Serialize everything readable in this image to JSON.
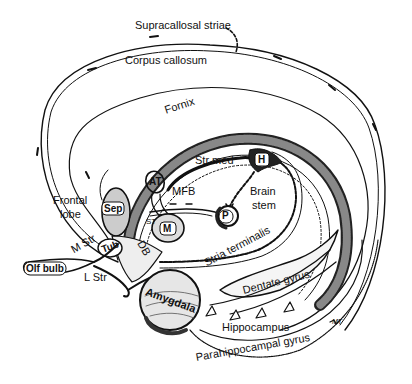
{
  "diagram": {
    "colors": {
      "ink": "#111111",
      "background": "#ffffff",
      "shade": "#555555"
    },
    "labels": {
      "supracallosal_striae": "Supracallosal striae",
      "corpus_callosum": "Corpus callosum",
      "fornix": "Fornix",
      "str_med": "Str med",
      "habenula": "H",
      "brain_stem_line1": "Brain",
      "brain_stem_line2": "stem",
      "anterior_thalamus": "AT",
      "mfb": "MFB",
      "frontal_lobe_line1": "Frontal",
      "frontal_lobe_line2": "lobe",
      "septum": "Sep",
      "mammillary": "M",
      "interpeduncular": "P",
      "st": "ST",
      "m_str": "M Str",
      "tub": "Tub",
      "db": "DB",
      "olf_bulb": "Olf bulb",
      "l_str": "L Str",
      "amygdala": "Amygdala",
      "stria_terminalis": "Stria terminalis",
      "dentate_gyrus": "Dentate gyrus",
      "hippocampus": "Hippocampus",
      "parahippocampal_gyrus": "Parahippocampal gyrus",
      "signature": "MT"
    }
  }
}
